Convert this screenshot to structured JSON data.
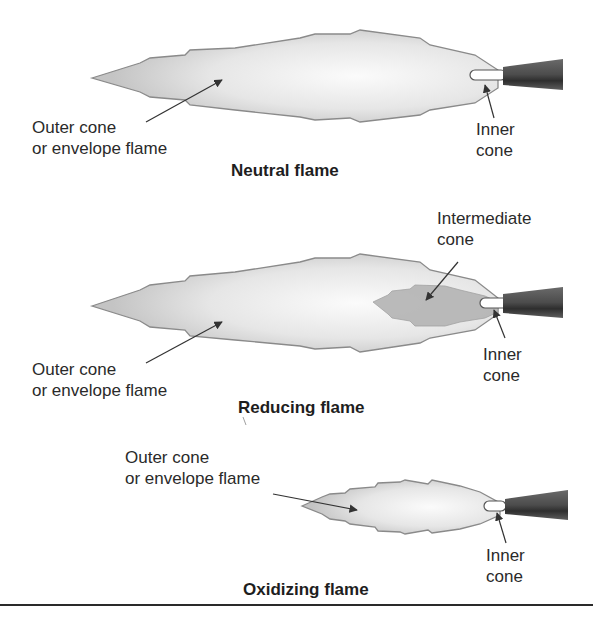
{
  "figure": {
    "panels": [
      {
        "id": "neutral",
        "title": "Neutral flame",
        "labels": {
          "outer_line1": "Outer cone",
          "outer_line2": "or envelope flame",
          "inner_line1": "Inner",
          "inner_line2": "cone"
        }
      },
      {
        "id": "reducing",
        "title": "Reducing flame",
        "labels": {
          "intermediate_line1": "Intermediate",
          "intermediate_line2": "cone",
          "outer_line1": "Outer cone",
          "outer_line2": "or envelope flame",
          "inner_line1": "Inner",
          "inner_line2": "cone"
        }
      },
      {
        "id": "oxidizing",
        "title": "Oxidizing flame",
        "labels": {
          "outer_line1": "Outer cone",
          "outer_line2": "or envelope flame",
          "inner_line1": "Inner",
          "inner_line2": "cone"
        }
      }
    ],
    "colors": {
      "flame_outline": "#8a8a8a",
      "flame_fill_edge": "#c8c8c8",
      "flame_fill_core": "#f4f4f4",
      "intermediate_fill": "#b0b0b0",
      "torch_tip": "#5a5a5a",
      "arrow": "#333333"
    }
  }
}
